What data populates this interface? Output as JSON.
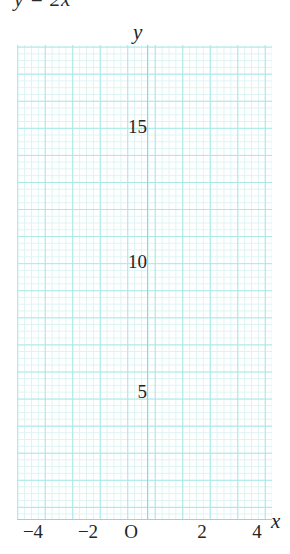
{
  "equation": {
    "text": "y = 2x",
    "clipped": true
  },
  "axes": {
    "y_name": "y",
    "x_name": "x",
    "origin_label": "O"
  },
  "ticks": {
    "y": [
      "15",
      "10",
      "5"
    ],
    "x": [
      "−4",
      "−2",
      "2",
      "4"
    ]
  },
  "colors": {
    "grid_minor": "#ddf4f3",
    "grid_major": "#a8e8e8",
    "axis_line": "#7fdede",
    "text": "#242424",
    "background": "#ffffff"
  },
  "chart_data": {
    "type": "line",
    "title": "y = 2x",
    "xlabel": "x",
    "ylabel": "y",
    "xlim": [
      -4.75,
      4.55
    ],
    "ylim": [
      -0.1,
      17.6
    ],
    "grid": true,
    "grid_major_step": 1,
    "grid_minor_step": 0.25,
    "legend": "none",
    "xticks": [
      -4,
      -2,
      0,
      2,
      4
    ],
    "xticklabels": [
      "−4",
      "−2",
      "O",
      "2",
      "4"
    ],
    "yticks": [
      5,
      10,
      15
    ],
    "yticklabels": [
      "5",
      "10",
      "15"
    ],
    "series": [
      {
        "name": "y = 2x",
        "drawn": false,
        "x": [
          -4,
          -2,
          0,
          2,
          4
        ],
        "values": [
          -8,
          -4,
          0,
          4,
          8
        ]
      }
    ],
    "annotations": [],
    "note": "Empty coordinate grid provided for plotting; no data curve is drawn in the figure."
  }
}
